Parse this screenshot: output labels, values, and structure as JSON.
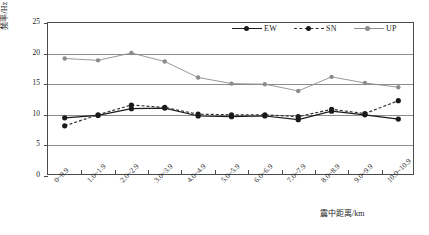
{
  "chart_data": {
    "type": "line",
    "title": "",
    "xlabel": "震中距离/km",
    "ylabel": "频率/Hz",
    "ylim": [
      0,
      25
    ],
    "yticks": [
      0,
      5,
      10,
      15,
      20,
      25
    ],
    "grid": true,
    "legend_position": "top-right",
    "categories": [
      "0~0.9",
      "1.0~1.9",
      "2.0~2.9",
      "3.0~3.9",
      "4.0~4.9",
      "5.0~5.9",
      "6.0~6.9",
      "7.0~7.9",
      "8.0~8.9",
      "9.0~9.9",
      "10.0~10.9"
    ],
    "series": [
      {
        "name": "EW",
        "color": "#1a1a1a",
        "style": "solid",
        "values": [
          9.5,
          9.9,
          11.0,
          11.1,
          9.8,
          9.7,
          9.8,
          9.2,
          10.6,
          10.0,
          9.3
        ]
      },
      {
        "name": "SN",
        "color": "#333333",
        "style": "dashed",
        "values": [
          8.2,
          10.0,
          11.6,
          11.2,
          10.1,
          10.0,
          10.0,
          9.7,
          10.9,
          10.2,
          12.3
        ]
      },
      {
        "name": "UP",
        "color": "#8c8c8c",
        "style": "solid",
        "values": [
          19.2,
          18.9,
          20.1,
          18.7,
          16.1,
          15.1,
          15.0,
          13.9,
          16.2,
          15.2,
          14.5
        ]
      }
    ]
  },
  "legend": {
    "items": [
      {
        "label": "EW"
      },
      {
        "label": "SN"
      },
      {
        "label": "UP"
      }
    ]
  },
  "caption": ""
}
